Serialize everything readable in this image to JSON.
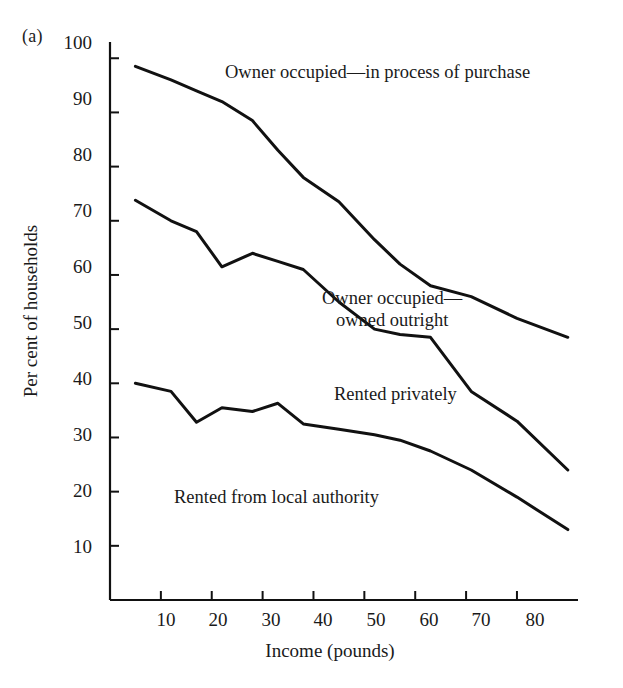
{
  "figure": {
    "panel_label": "(a)",
    "background_color": "#ffffff",
    "line_color": "#111111"
  },
  "chart_data": {
    "type": "line",
    "title": "",
    "subtitle": "",
    "xlabel": "Income (pounds)",
    "ylabel": "Per cent of households",
    "xlim": [
      0,
      92
    ],
    "ylim": [
      0,
      103
    ],
    "xticks": [
      10,
      20,
      30,
      40,
      50,
      60,
      70,
      80
    ],
    "yticks": [
      10,
      20,
      30,
      40,
      50,
      60,
      70,
      80,
      90,
      100
    ],
    "grid": false,
    "legend": "inline-annotations",
    "annotations": [
      {
        "text": "Owner occupied—in process of purchase",
        "series": "Owner occupied - in process of purchase",
        "x_px": 225,
        "y_px": 70
      },
      {
        "text": "Owner occupied—\n   owned outright",
        "series": "Owner occupied - owned outright",
        "x_px": 322,
        "y_px": 296
      },
      {
        "text": "Rented privately",
        "series": "Rented privately",
        "x_px": 334,
        "y_px": 392
      },
      {
        "text": "Rented from local authority",
        "series": "Rented from local authority",
        "x_px": 174,
        "y_px": 495
      }
    ],
    "series": [
      {
        "name": "Owner occupied - in process of purchase",
        "x": [
          5,
          12,
          17,
          22,
          28,
          33,
          38,
          45,
          52,
          57,
          63,
          71,
          80,
          90
        ],
        "values": [
          98.5,
          96,
          94,
          92,
          88.5,
          83,
          78,
          73.5,
          66.5,
          62,
          58,
          56,
          52,
          48.5
        ]
      },
      {
        "name": "Owner occupied - owned outright",
        "x": [
          5,
          12,
          17,
          22,
          28,
          33,
          38,
          45,
          52,
          57,
          63,
          71,
          80,
          90
        ],
        "values": [
          73.8,
          70,
          68,
          61.5,
          64,
          62.5,
          61,
          55,
          50,
          49,
          48.5,
          38.5,
          33,
          24
        ]
      },
      {
        "name": "Rented privately and local authority boundary",
        "x": [
          5,
          12,
          17,
          22,
          28,
          33,
          38,
          45,
          52,
          57,
          63,
          71,
          80,
          90
        ],
        "values": [
          40,
          38.5,
          32.8,
          35.5,
          34.8,
          36.3,
          32.5,
          31.5,
          30.5,
          29.5,
          27.5,
          24,
          19,
          13
        ]
      }
    ]
  }
}
